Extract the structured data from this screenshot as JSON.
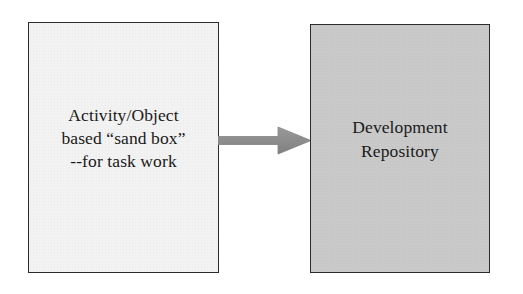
{
  "diagram": {
    "type": "flow",
    "background_color": "#ffffff",
    "nodes": [
      {
        "id": "sandbox",
        "label": "Activity/Object\nbased “sand box”\n--for task work",
        "lines": [
          "Activity/Object",
          "based “sand box”",
          "--for task work"
        ],
        "shape": "rectangle",
        "fill_color": "#f2f2f2",
        "border_color": "#2b2b2b"
      },
      {
        "id": "repository",
        "label": "Development\nRepository",
        "lines": [
          "Development",
          "Repository"
        ],
        "shape": "rectangle",
        "fill_color": "#c9c9c9",
        "border_color": "#2b2b2b"
      }
    ],
    "edges": [
      {
        "id": "sandbox-to-repository",
        "from": "sandbox",
        "to": "repository",
        "style": "block-arrow",
        "direction": "right",
        "label": "",
        "color": "#8a8a8a"
      }
    ]
  }
}
